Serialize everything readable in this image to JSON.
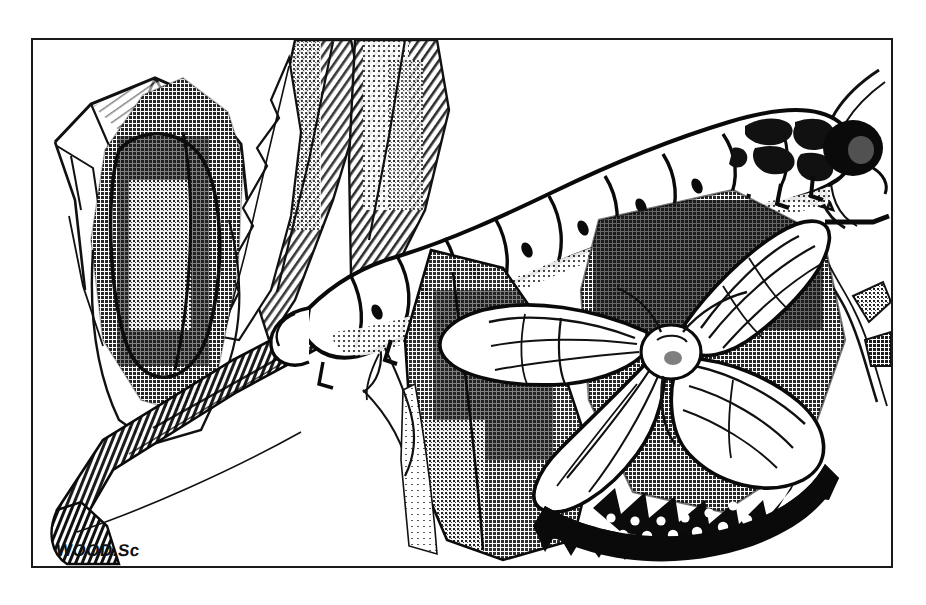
{
  "plate": {
    "title": "Moth life-cycle engraving",
    "medium": "black and white line engraving with halftone stipple",
    "background_color": "#ffffff",
    "ink_color": "#111111",
    "frame": {
      "border_color": "#1a1a1a",
      "border_width_px": 2,
      "x": 31,
      "y": 38,
      "width": 862,
      "height": 530
    },
    "signature": {
      "text": "WOOD.Sc",
      "position": "bottom-left inside frame"
    }
  },
  "scene": {
    "description": "A branch runs diagonally from lower-left to upper-right. A silk cocoon hangs at the left, a large segmented caterpillar crawls along the upper branch, and an adult moth with spread wings rests at the lower right among dark leaves.",
    "subjects": [
      {
        "name": "cocoon",
        "label": "cocoon in silk web",
        "stage": "pupa",
        "position": "upper left",
        "tone": "dark mottled mass inside a pale tented web"
      },
      {
        "name": "caterpillar",
        "label": "caterpillar",
        "stage": "larva",
        "position": "upper right along branch",
        "segments": 9,
        "head": "dark rounded head gripping a twig",
        "tone": "pale body with dark segment outlines and spiracle dots"
      },
      {
        "name": "moth",
        "label": "adult moth",
        "stage": "imago",
        "position": "lower right",
        "wings": 4,
        "tone": "pale veined wings, white furry thorax, scalloped dark hindwing margin with white spots"
      },
      {
        "name": "branch",
        "label": "branch",
        "position": "diagonal, lower-left to upper-right",
        "tone": "dark cross-hatched bark"
      },
      {
        "name": "leaves",
        "label": "leaves",
        "position": "upper centre and lower centre-right",
        "tone": "diagonal hatching and halftone shading"
      },
      {
        "name": "twig",
        "label": "twig",
        "position": "far right",
        "tone": "thin outlined stem"
      }
    ],
    "palette": {
      "paper": "#ffffff",
      "ink": "#111111",
      "mid_tone": "#6f6f6f",
      "light_tone": "#b8b8b8",
      "shadow_tone": "#3a3a3a"
    }
  }
}
